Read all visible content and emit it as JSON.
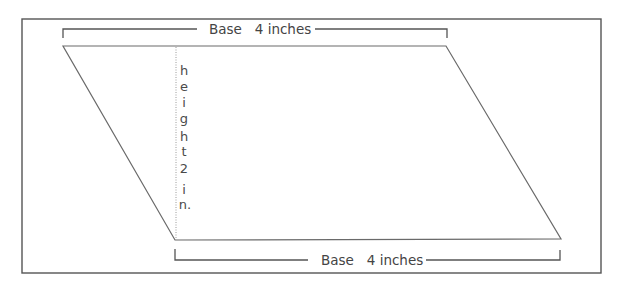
{
  "figure": {
    "top_base_label": "Base   4 inches",
    "bottom_base_label": "Base   4 inches",
    "height_label": {
      "word": [
        "h",
        "e",
        "i",
        "g",
        "h",
        "t"
      ],
      "value": "2",
      "unit": [
        "i",
        "n."
      ]
    },
    "colors": {
      "frame": "#555555",
      "shape": "#6a6a6a",
      "text": "#444444",
      "height_line": "#9a9a9a"
    }
  }
}
